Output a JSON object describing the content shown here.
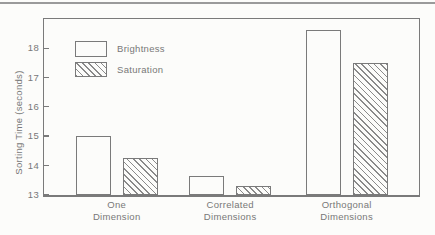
{
  "chart_data": {
    "type": "bar",
    "title": "",
    "xlabel": "",
    "ylabel": "Sorting Time (seconds)",
    "categories": [
      {
        "line1": "One",
        "line2": "Dimension"
      },
      {
        "line1": "Correlated",
        "line2": "Dimensions"
      },
      {
        "line1": "Orthogonal",
        "line2": "Dimensions"
      }
    ],
    "series": [
      {
        "name": "Brightness",
        "fill": "solid",
        "values": [
          15.0,
          13.65,
          18.65
        ]
      },
      {
        "name": "Saturation",
        "fill": "hatched",
        "values": [
          14.25,
          13.3,
          17.5
        ]
      }
    ],
    "y_ticks": [
      13,
      14,
      15,
      16,
      17,
      18
    ],
    "ylim": [
      13,
      19
    ],
    "legend_position": "top-left",
    "grid": false
  },
  "colors": {
    "line": "#7a7a7a",
    "text": "#787878",
    "hatch": "#8a8a8a",
    "background": "#fcfcfa"
  }
}
